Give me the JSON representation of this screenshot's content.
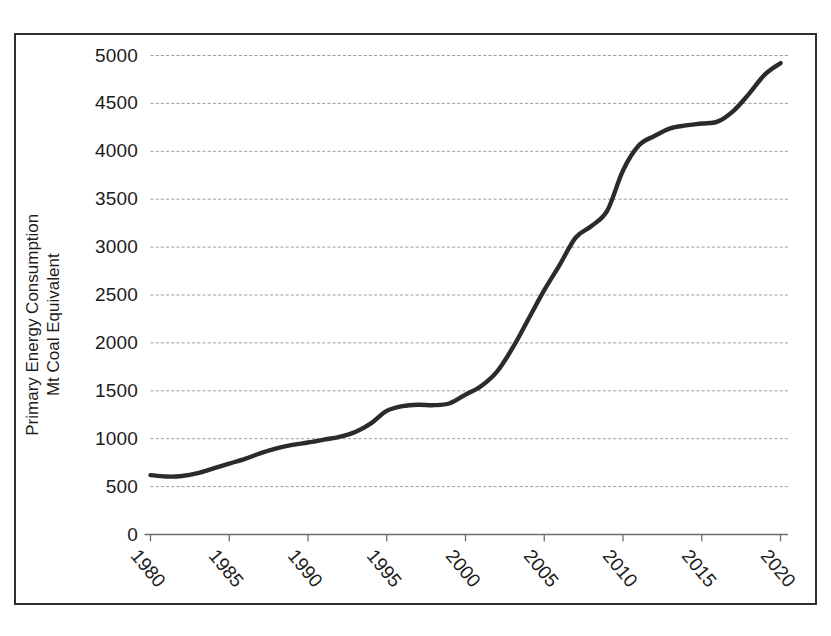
{
  "chart_data": {
    "type": "line",
    "title": "",
    "xlabel": "",
    "ylabel": "Primary Energy Consumption\nMt Coal Equivalent",
    "ylabel_line1": "Primary Energy Consumption",
    "ylabel_line2": "Mt Coal Equivalent",
    "xlim": [
      1980,
      2020
    ],
    "ylim": [
      0,
      5000
    ],
    "grid": true,
    "grid_axis": "y",
    "legend": "none",
    "line_color": "#2b2b2b",
    "grid_color": "#9a9a9a",
    "axis_color": "#6e6e6e",
    "frame_color": "#2e2e2e",
    "yticks": [
      0,
      500,
      1000,
      1500,
      2000,
      2500,
      3000,
      3500,
      4000,
      4500,
      5000
    ],
    "ytick_labels": [
      "0",
      "500",
      "1000",
      "1500",
      "2000",
      "2500",
      "3000",
      "3500",
      "4000",
      "4500",
      "5000"
    ],
    "xticks": [
      1980,
      1985,
      1990,
      1995,
      2000,
      2005,
      2010,
      2015,
      2020
    ],
    "xtick_labels": [
      "1980",
      "1985",
      "1990",
      "1995",
      "2000",
      "2005",
      "2010",
      "2015",
      "2020"
    ],
    "series": [
      {
        "name": "Primary Energy Consumption",
        "x": [
          1980,
          1981,
          1982,
          1983,
          1984,
          1985,
          1986,
          1987,
          1988,
          1989,
          1990,
          1991,
          1992,
          1993,
          1994,
          1995,
          1996,
          1997,
          1998,
          1999,
          2000,
          2001,
          2002,
          2003,
          2004,
          2005,
          2006,
          2007,
          2008,
          2009,
          2010,
          2011,
          2012,
          2013,
          2014,
          2015,
          2016,
          2017,
          2018,
          2019,
          2020
        ],
        "values": [
          620,
          605,
          610,
          640,
          690,
          740,
          790,
          850,
          900,
          935,
          960,
          990,
          1020,
          1070,
          1160,
          1290,
          1340,
          1355,
          1350,
          1370,
          1460,
          1550,
          1700,
          1950,
          2250,
          2550,
          2820,
          3100,
          3220,
          3380,
          3800,
          4060,
          4160,
          4240,
          4270,
          4290,
          4310,
          4420,
          4600,
          4800,
          4920
        ]
      }
    ]
  }
}
